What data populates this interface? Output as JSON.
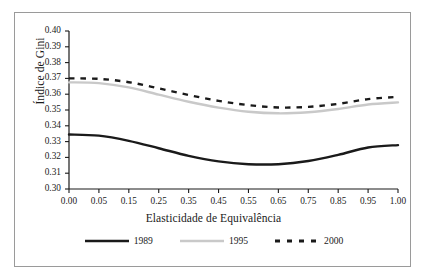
{
  "chart_data": {
    "type": "line",
    "title": "",
    "xlabel": "Elasticidade de Equivalência",
    "ylabel": "Índice de Gini",
    "xlim": [
      0.0,
      1.0
    ],
    "ylim": [
      0.3,
      0.4
    ],
    "grid": false,
    "legend_position": "bottom",
    "xtick_labels": [
      "0.00",
      "0.05",
      "0.15",
      "0.25",
      "0.35",
      "0.45",
      "0.55",
      "0.65",
      "0.75",
      "0.85",
      "0.95",
      "1.00"
    ],
    "xtick_values": [
      0.0,
      0.05,
      0.15,
      0.25,
      0.35,
      0.45,
      0.55,
      0.65,
      0.75,
      0.85,
      0.95,
      1.0
    ],
    "ytick_labels": [
      "0.30",
      "0.31",
      "0.32",
      "0.33",
      "0.34",
      "0.35",
      "0.36",
      "0.37",
      "0.38",
      "0.39",
      "0.40"
    ],
    "ytick_values": [
      0.3,
      0.31,
      0.32,
      0.33,
      0.34,
      0.35,
      0.36,
      0.37,
      0.38,
      0.39,
      0.4
    ],
    "x": [
      0.0,
      0.05,
      0.15,
      0.25,
      0.35,
      0.45,
      0.55,
      0.65,
      0.75,
      0.85,
      0.95,
      1.0
    ],
    "series": [
      {
        "name": "1989",
        "color": "#1a1a1a",
        "style": "solid",
        "width": 2.4,
        "values": [
          0.3345,
          0.3338,
          0.3305,
          0.3258,
          0.321,
          0.3175,
          0.3157,
          0.3157,
          0.3177,
          0.3216,
          0.3263,
          0.3278
        ]
      },
      {
        "name": "1995",
        "color": "#c9c9c9",
        "style": "solid",
        "width": 2.4,
        "values": [
          0.3675,
          0.367,
          0.3643,
          0.3597,
          0.3552,
          0.3515,
          0.3489,
          0.3479,
          0.3486,
          0.3506,
          0.3535,
          0.3548
        ]
      },
      {
        "name": "2000",
        "color": "#1a1a1a",
        "style": "dashed",
        "width": 2.4,
        "values": [
          0.37,
          0.3697,
          0.3676,
          0.3637,
          0.3595,
          0.3558,
          0.3531,
          0.3516,
          0.352,
          0.3539,
          0.3569,
          0.3583
        ]
      }
    ]
  },
  "legend": {
    "items": [
      {
        "label": "1989"
      },
      {
        "label": "1995"
      },
      {
        "label": "2000"
      }
    ]
  },
  "axes": {
    "y_title": "Índice de Gini",
    "x_title": "Elasticidade de Equivalência"
  }
}
